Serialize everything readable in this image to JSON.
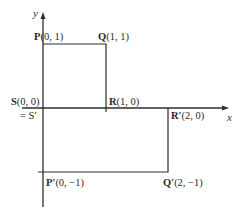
{
  "diagram": {
    "title": "",
    "axes": {
      "x_label": "x",
      "y_label": "y"
    },
    "points": [
      {
        "id": "P",
        "letter": "P",
        "coords": "(0, 1)",
        "x": 0,
        "y": 1
      },
      {
        "id": "Q",
        "letter": "Q",
        "coords": "(1, 1)",
        "x": 1,
        "y": 1
      },
      {
        "id": "S",
        "letter": "S",
        "coords": "(0, 0)",
        "x": 0,
        "y": 0
      },
      {
        "id": "R",
        "letter": "R",
        "coords": "(1, 0)",
        "x": 1,
        "y": 0
      },
      {
        "id": "S-prime",
        "letter": "= S′",
        "coords": "",
        "x": 0,
        "y": 0
      },
      {
        "id": "R-prime",
        "letter": "R′",
        "coords": "(2, 0)",
        "x": 2,
        "y": 0
      },
      {
        "id": "P-prime",
        "letter": "P′",
        "coords": "(0, −1)",
        "x": 0,
        "y": -1
      },
      {
        "id": "Q-prime",
        "letter": "Q′",
        "coords": "(2, −1)",
        "x": 2,
        "y": -1
      }
    ],
    "shapes": [
      {
        "name": "original-square",
        "vertices": [
          "S",
          "P",
          "Q",
          "R"
        ]
      },
      {
        "name": "transformed-rectangle",
        "vertices": [
          "S'",
          "R'",
          "Q'",
          "P'"
        ]
      }
    ],
    "colors": {
      "line": "#2e2e2e",
      "text": "#2b2b2b",
      "background": "#ffffff"
    }
  }
}
